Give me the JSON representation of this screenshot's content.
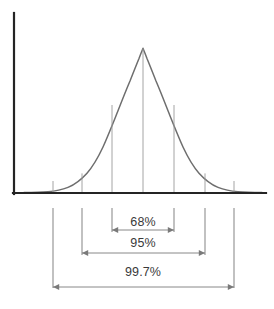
{
  "figure": {
    "background_color": "#ffffff",
    "axis_color": "#242424",
    "curve_color": "#6e6e6e",
    "gridline_color": "#9a9a9a",
    "bracket_color": "#8e8e8e",
    "arrow_color": "#7a7a7a",
    "label_color": "#3a3a3a"
  },
  "bands": [
    {
      "label": "68%",
      "label_x": 143,
      "label_y": 222,
      "arrow_y": 230,
      "from_x": 112,
      "to_x": 174
    },
    {
      "label": "95%",
      "label_x": 143,
      "label_y": 243,
      "arrow_y": 253,
      "from_x": 82,
      "to_x": 205
    },
    {
      "label": "99.7%",
      "label_x": 143,
      "label_y": 272,
      "arrow_y": 287,
      "from_x": 53,
      "to_x": 234
    }
  ],
  "chart_data": {
    "type": "line",
    "xlabel": "",
    "ylabel": "",
    "grid": false,
    "legend": "none",
    "curve": {
      "name": "normal probability density",
      "mean": 0,
      "sd": 1,
      "peak_pixel": {
        "x": 143,
        "y": 48
      },
      "baseline_pixel_y": 193,
      "x_sd_values": [
        -3,
        -2,
        -1,
        0,
        1,
        2,
        3
      ],
      "x_pixel_values": [
        53,
        82,
        112,
        143,
        174,
        205,
        234
      ],
      "y_pixel_values": [
        191.4,
        173.4,
        105.0,
        48.0,
        105.0,
        173.4,
        191.4
      ],
      "density_values": [
        0.0111,
        0.054,
        0.242,
        0.3989,
        0.242,
        0.054,
        0.0111
      ]
    },
    "gridlines_at_sd": [
      -3,
      -2,
      -1,
      0,
      1,
      2,
      3
    ],
    "annotations": [
      {
        "text": "68%",
        "interval_sd": [
          -1,
          1
        ],
        "value": 68
      },
      {
        "text": "95%",
        "interval_sd": [
          -2,
          2
        ],
        "value": 95
      },
      {
        "text": "99.7%",
        "interval_sd": [
          -3,
          3
        ],
        "value": 99.7
      }
    ],
    "axes": {
      "y_axis": {
        "x": 14,
        "y_top": 13,
        "y_bottom": 194
      },
      "x_axis": {
        "y": 193,
        "x_left": 13,
        "x_right": 266
      }
    }
  }
}
